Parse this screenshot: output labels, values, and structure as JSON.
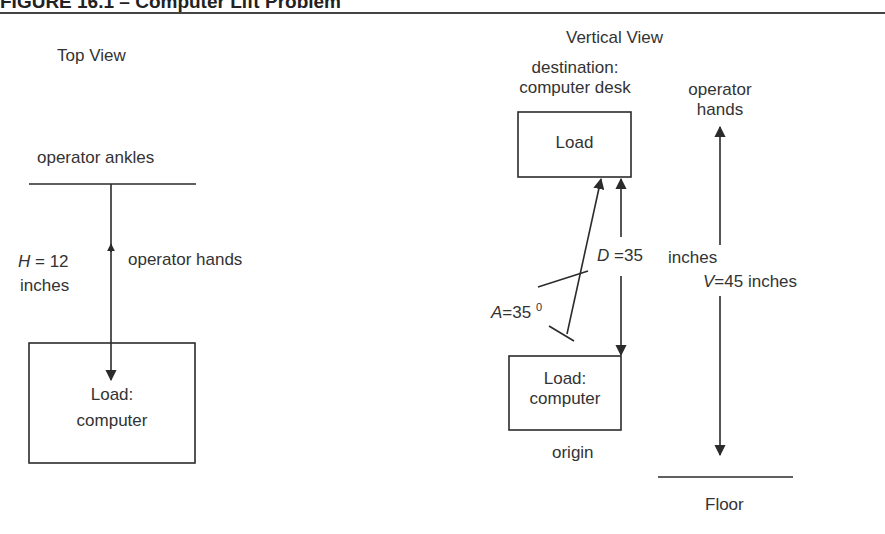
{
  "figure": {
    "title": "FIGURE 16.1 – Computer Lift Problem"
  },
  "top_view": {
    "heading": "Top View",
    "ankles_label": "operator ankles",
    "hands_label": "operator hands",
    "h_var": "H",
    "h_value": " = 12",
    "h_unit": "inches",
    "load_line1": "Load:",
    "load_line2": "computer"
  },
  "vertical_view": {
    "heading": "Vertical View",
    "destination_line1": "destination:",
    "destination_line2": "computer desk",
    "dest_load": "Load",
    "hands_line1": "operator",
    "hands_line2": "hands",
    "d_var": "D",
    "d_value": " =35",
    "d_unit": "inches",
    "v_var": "V",
    "v_value": "=45 inches",
    "a_var": "A",
    "a_value": "=35 ",
    "a_degree": "0",
    "origin_load_line1": "Load:",
    "origin_load_line2": "computer",
    "origin_label": "origin",
    "floor_label": "Floor"
  },
  "colors": {
    "line": "#2b2b2b",
    "text": "#333333",
    "background": "#ffffff"
  }
}
